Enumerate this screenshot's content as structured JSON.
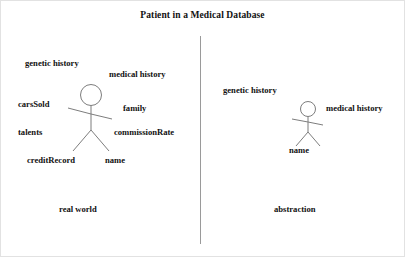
{
  "diagram": {
    "title": "Patient in a Medical Database",
    "divider": {
      "name": "vertical-divider"
    },
    "panels": [
      {
        "id": "real-world",
        "caption": "real world",
        "figure_name": "stick-figure-person",
        "labels": [
          {
            "text": "genetic history",
            "x": 24,
            "y": 58
          },
          {
            "text": "medical history",
            "x": 108,
            "y": 69
          },
          {
            "text": "carsSold",
            "x": 17,
            "y": 99
          },
          {
            "text": "family",
            "x": 122,
            "y": 103
          },
          {
            "text": "talents",
            "x": 17,
            "y": 127
          },
          {
            "text": "commissionRate",
            "x": 113,
            "y": 127
          },
          {
            "text": "creditRecord",
            "x": 26,
            "y": 155
          },
          {
            "text": "name",
            "x": 104,
            "y": 155
          }
        ]
      },
      {
        "id": "abstraction",
        "caption": "abstraction",
        "figure_name": "stick-figure-person",
        "labels": [
          {
            "text": "genetic history",
            "x": 222,
            "y": 85
          },
          {
            "text": "medical history",
            "x": 325,
            "y": 103
          },
          {
            "text": "name",
            "x": 288,
            "y": 145
          }
        ]
      }
    ],
    "captions": [
      {
        "text": "real world",
        "x": 58,
        "y": 204
      },
      {
        "text": "abstraction",
        "x": 273,
        "y": 204
      }
    ],
    "colors": {
      "ink": "#111111",
      "stroke": "#7d7d7d",
      "divider": "#9a9a9a",
      "background": "#ffffff",
      "border": "#e2e2e2"
    }
  }
}
